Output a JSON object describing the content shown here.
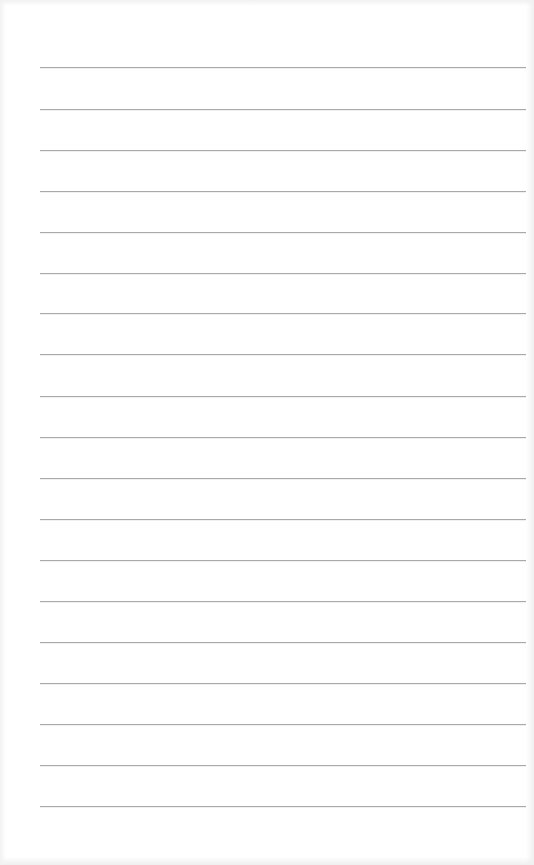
{
  "page": {
    "type": "lined-paper",
    "background_color": "#ffffff",
    "line_color": "#a9a9a9",
    "line_count": 19,
    "line_left_px": 40,
    "line_right_px": 526,
    "first_line_y_px": 67,
    "line_spacing_px": 41.06,
    "lines": [
      {
        "index": 1,
        "y": 67,
        "text": ""
      },
      {
        "index": 2,
        "y": 109,
        "text": ""
      },
      {
        "index": 3,
        "y": 150,
        "text": ""
      },
      {
        "index": 4,
        "y": 191,
        "text": ""
      },
      {
        "index": 5,
        "y": 232,
        "text": ""
      },
      {
        "index": 6,
        "y": 273,
        "text": ""
      },
      {
        "index": 7,
        "y": 313,
        "text": ""
      },
      {
        "index": 8,
        "y": 354,
        "text": ""
      },
      {
        "index": 9,
        "y": 396,
        "text": ""
      },
      {
        "index": 10,
        "y": 437,
        "text": ""
      },
      {
        "index": 11,
        "y": 478,
        "text": ""
      },
      {
        "index": 12,
        "y": 519,
        "text": ""
      },
      {
        "index": 13,
        "y": 560,
        "text": ""
      },
      {
        "index": 14,
        "y": 601,
        "text": ""
      },
      {
        "index": 15,
        "y": 642,
        "text": ""
      },
      {
        "index": 16,
        "y": 683,
        "text": ""
      },
      {
        "index": 17,
        "y": 724,
        "text": ""
      },
      {
        "index": 18,
        "y": 765,
        "text": ""
      },
      {
        "index": 19,
        "y": 806,
        "text": ""
      }
    ]
  }
}
